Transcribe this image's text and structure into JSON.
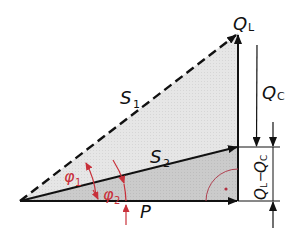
{
  "diagram": {
    "type": "power-triangle",
    "labels": {
      "S1": {
        "main": "S",
        "sub": "1"
      },
      "S2": {
        "main": "S",
        "sub": "2"
      },
      "QL": {
        "main": "Q",
        "sub": "L"
      },
      "QC": {
        "main": "Q",
        "sub": "C"
      },
      "P": {
        "main": "P"
      },
      "phi1": {
        "main": "φ",
        "sub": "1"
      },
      "phi2": {
        "main": "φ",
        "sub": "2"
      },
      "diff": {
        "text": "QL−QC",
        "a": "Q",
        "a_sub": "L",
        "sep": "−",
        "b": "Q",
        "b_sub": "C"
      }
    },
    "colors": {
      "line": "#111111",
      "angle": "#c8303a",
      "fill_upper": "#e4e4e4",
      "fill_lower": "#c9c9c9"
    }
  }
}
